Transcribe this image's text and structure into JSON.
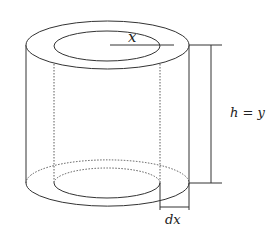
{
  "diagram": {
    "type": "cylindrical-shell",
    "labels": {
      "radius": "x",
      "height": "h = y",
      "thickness": "dx"
    },
    "colors": {
      "stroke": "#333333",
      "background": "#ffffff"
    }
  }
}
